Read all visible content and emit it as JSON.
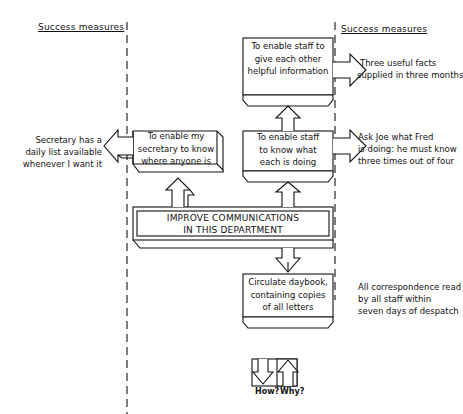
{
  "headers": {
    "left": "Success measures",
    "right": "Success measures"
  },
  "core": {
    "line1": "IMPROVE COMMUNICATIONS",
    "line2": "IN THIS DEPARTMENT"
  },
  "objectives": {
    "secretary": [
      "To enable my",
      "secretary to know",
      "where anyone is"
    ],
    "staff_know": [
      "To enable staff",
      "to know what",
      "each is doing"
    ],
    "staff_info": [
      "To enable staff to",
      "give each other",
      "helpful information"
    ],
    "daybook": [
      "Circulate daybook,",
      "containing copies",
      "of all letters"
    ]
  },
  "measures": {
    "secretary": [
      "Secretary has a",
      "daily list available",
      "whenever I want it"
    ],
    "staff_info": [
      "Three useful facts",
      "supplied in three months"
    ],
    "staff_know": [
      "Ask Joe what Fred",
      "is doing: he must know",
      "three times out of four"
    ],
    "daybook": [
      "All correspondence read",
      "by all staff within",
      "seven days of despatch"
    ]
  },
  "legend": {
    "how": "How?",
    "why": "Why?"
  },
  "colors": {
    "ink": "#111111",
    "paper": "#ffffff"
  }
}
